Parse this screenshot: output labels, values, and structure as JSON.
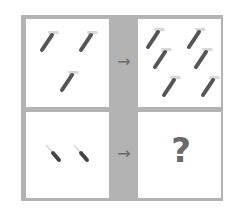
{
  "puzzle": {
    "top_left": {
      "item": "hammer",
      "count": 3
    },
    "top_right": {
      "item": "hammer",
      "count": 6
    },
    "bottom_left": {
      "item": "screwdriver",
      "count": 2
    },
    "bottom_right": {
      "label": "?"
    },
    "arrow": "→"
  },
  "colors": {
    "frame": "#b3b3b3",
    "handle": "#555555",
    "head": "#d8d8d8",
    "text": "#6a6a6a"
  }
}
